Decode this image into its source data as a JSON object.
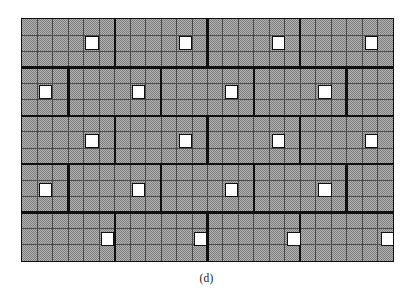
{
  "figure": {
    "caption": "(d)",
    "type": "schematic-grid-diagram",
    "geometry": {
      "origin_x": 21,
      "origin_y": 18,
      "width": 373,
      "height": 244,
      "fine_columns": 24,
      "fine_rows": 15,
      "cell_width": 15.54,
      "cell_height": 16.27,
      "major_rows": 5,
      "major_row_height_cells": 3,
      "major_block_width_cells": 6
    },
    "colors": {
      "fill": "#b3b3b3",
      "dither_dark": "#7d7d7d",
      "thin_line": "#4a4a4a",
      "thick_line": "#101010",
      "white_cell": "#ffffff",
      "background": "#ffffff",
      "caption_text": "#1b1b1b"
    },
    "line_weights": {
      "thin": 1.0,
      "thick": 2.4,
      "outer_border": 1.6
    },
    "major_block_rows": [
      {
        "index": 0,
        "offset_cells": 0,
        "boundaries_cells": [
          0,
          6,
          12,
          18,
          24
        ]
      },
      {
        "index": 1,
        "offset_cells": 3,
        "boundaries_cells": [
          0,
          3,
          9,
          15,
          21,
          24
        ]
      },
      {
        "index": 2,
        "offset_cells": 0,
        "boundaries_cells": [
          0,
          6,
          12,
          18,
          24
        ]
      },
      {
        "index": 3,
        "offset_cells": 3,
        "boundaries_cells": [
          0,
          3,
          9,
          15,
          21,
          24
        ]
      },
      {
        "index": 4,
        "offset_cells": 0,
        "boundaries_cells": [
          0,
          6,
          12,
          18,
          24
        ]
      }
    ],
    "white_cells": [
      {
        "row": 1,
        "col": 4
      },
      {
        "row": 1,
        "col": 10
      },
      {
        "row": 1,
        "col": 16
      },
      {
        "row": 1,
        "col": 22
      },
      {
        "row": 4,
        "col": 1
      },
      {
        "row": 4,
        "col": 7
      },
      {
        "row": 4,
        "col": 13
      },
      {
        "row": 4,
        "col": 19
      },
      {
        "row": 7,
        "col": 4
      },
      {
        "row": 7,
        "col": 10
      },
      {
        "row": 7,
        "col": 16
      },
      {
        "row": 7,
        "col": 22
      },
      {
        "row": 10,
        "col": 1
      },
      {
        "row": 10,
        "col": 7
      },
      {
        "row": 10,
        "col": 13
      },
      {
        "row": 10,
        "col": 19
      },
      {
        "row": 13,
        "col": 5
      },
      {
        "row": 13,
        "col": 11
      },
      {
        "row": 13,
        "col": 17
      },
      {
        "row": 13,
        "col": 23
      }
    ]
  }
}
